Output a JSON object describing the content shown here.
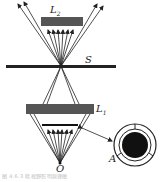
{
  "figure": {
    "type": "dark-field illumination optical diagram",
    "labels": {
      "lens_top": "L2",
      "lens_top_main": "L",
      "lens_top_sub": "2",
      "lens_bottom_main": "L",
      "lens_bottom_sub": "1",
      "specimen_plane": "S",
      "source": "O",
      "annular_stop": "A"
    },
    "caption": "图 4.6.3    暗视野照明原理图",
    "colors": {
      "ink": "#222222",
      "lens_fill": "#555555",
      "stop_fill": "#111111",
      "background": "#ffffff"
    }
  }
}
